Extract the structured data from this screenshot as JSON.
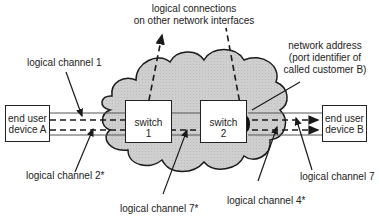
{
  "diagram": {
    "title_labels": {
      "top": [
        "logical connections",
        "on other network interfaces"
      ],
      "network_address": [
        "network address",
        "(port identifier of",
        "called customer B)"
      ]
    },
    "nodes": {
      "device_a": [
        "end user",
        "device A"
      ],
      "device_b": [
        "end user",
        "device B"
      ],
      "switch1": [
        "switch",
        "1"
      ],
      "switch2": [
        "switch",
        "2"
      ]
    },
    "channel_labels": {
      "lc1": "logical channel 1",
      "lc2": "logical channel 2*",
      "lc7star": "logical channel 7*",
      "lc4": "logical channel 4*",
      "lc7": "logical channel 7"
    },
    "colors": {
      "cloud_fill": "#cfcfcf",
      "line": "#1a1a1a",
      "port": "#111111"
    }
  }
}
